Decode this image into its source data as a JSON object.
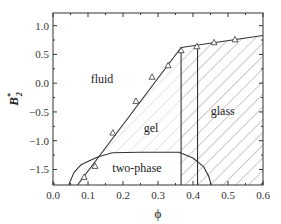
{
  "chart_data": {
    "type": "line",
    "title": "",
    "xlabel": "ϕ",
    "ylabel": "B*2",
    "ylabel_main": "B",
    "ylabel_sup": "*",
    "ylabel_sub": "2",
    "xlim": [
      0.0,
      0.6
    ],
    "ylim": [
      -1.77,
      1.22
    ],
    "grid": false,
    "x_ticks": [
      0.0,
      0.1,
      0.2,
      0.3,
      0.4,
      0.5,
      0.6
    ],
    "x_tick_labels": [
      "0.0",
      "0.1",
      "0.2",
      "0.3",
      "0.4",
      "0.5",
      "0.6"
    ],
    "y_ticks": [
      1.0,
      0.5,
      0.0,
      -0.5,
      -1.0,
      -1.5
    ],
    "y_tick_labels": [
      "1.0",
      "0.5",
      "0.0",
      "−0.5",
      "−1.0",
      "−1.5"
    ],
    "regions": [
      {
        "name": "fluid",
        "label": "fluid",
        "x": 0.14,
        "y": 0.0
      },
      {
        "name": "gel",
        "label": "gel",
        "x": 0.28,
        "y": -0.85
      },
      {
        "name": "glass",
        "label": "glass",
        "x": 0.485,
        "y": -0.55
      },
      {
        "name": "two-phase",
        "label": "two-phase",
        "x": 0.24,
        "y": -1.55
      }
    ],
    "series": [
      {
        "name": "fluid-gel boundary",
        "style": "line",
        "x": [
          0.07,
          0.366,
          0.6
        ],
        "y": [
          -1.77,
          0.62,
          0.83
        ]
      },
      {
        "name": "simulation points",
        "style": "open-triangle",
        "x": [
          0.089,
          0.12,
          0.171,
          0.237,
          0.283,
          0.329,
          0.366,
          0.411,
          0.46,
          0.52
        ],
        "y": [
          -1.63,
          -1.44,
          -0.86,
          -0.31,
          0.11,
          0.31,
          0.57,
          0.64,
          0.71,
          0.76
        ]
      },
      {
        "name": "two-phase coexistence curve",
        "style": "line",
        "x": [
          0.045,
          0.06,
          0.08,
          0.11,
          0.13,
          0.17,
          0.25,
          0.36,
          0.4,
          0.43,
          0.445,
          0.452
        ],
        "y": [
          -1.77,
          -1.55,
          -1.42,
          -1.33,
          -1.28,
          -1.21,
          -1.2,
          -1.2,
          -1.3,
          -1.45,
          -1.62,
          -1.77
        ]
      },
      {
        "name": "gel-glass boundary (left)",
        "style": "vertical-line",
        "x": [
          0.366,
          0.366
        ],
        "y": [
          -1.77,
          0.62
        ]
      },
      {
        "name": "glass boundary (right)",
        "style": "vertical-line",
        "x": [
          0.413,
          0.413
        ],
        "y": [
          -1.77,
          0.66
        ]
      }
    ],
    "hatching": [
      {
        "region": "gel",
        "color": "#c8c8c8"
      },
      {
        "region": "glass",
        "color": "#8a8a8a"
      }
    ]
  },
  "colors": {
    "axis": "#333333",
    "line": "#333333",
    "hatch_gel": "#c8c8c8",
    "hatch_glass": "#8a8a8a",
    "background": "#ffffff"
  }
}
